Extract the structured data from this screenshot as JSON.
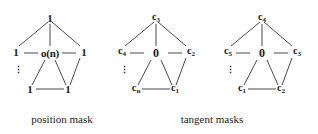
{
  "figure": {
    "type": "graph-diagram-set",
    "captions": [
      {
        "id": "position-mask",
        "text": "position mask"
      },
      {
        "id": "tangent-masks",
        "text": "tangent masks"
      }
    ],
    "stroke_color": "#1a1a1a",
    "background_color": "#ffffff"
  },
  "diagrams": [
    {
      "id": "position-mask",
      "center": {
        "label": "o(n)",
        "name": "center-node"
      },
      "nodes": [
        {
          "pos": "top",
          "label": "1"
        },
        {
          "pos": "left",
          "label": "1"
        },
        {
          "pos": "right",
          "label": "1"
        },
        {
          "pos": "bottom-left",
          "label": "1"
        },
        {
          "pos": "bottom-right",
          "label": "1"
        }
      ],
      "ellipsis": "⋮",
      "edges": [
        "top-left",
        "top-right",
        "top-center",
        "left-center",
        "right-center",
        "center-bottom-left",
        "center-bottom-right",
        "bottom-left-bottom-right",
        "right-bottom-right"
      ]
    },
    {
      "id": "tangent-mask-1",
      "center": {
        "label": "0",
        "name": "center-node"
      },
      "nodes": [
        {
          "pos": "top",
          "label": "c",
          "sub": "3"
        },
        {
          "pos": "left",
          "label": "c",
          "sub": "4"
        },
        {
          "pos": "right",
          "label": "c",
          "sub": "2"
        },
        {
          "pos": "bottom-left",
          "label": "c",
          "sub": "n"
        },
        {
          "pos": "bottom-right",
          "label": "c",
          "sub": "1"
        }
      ],
      "ellipsis": "⋮",
      "edges": [
        "top-left",
        "top-right",
        "top-center",
        "left-center",
        "right-center",
        "center-bottom-left",
        "center-bottom-right",
        "bottom-left-bottom-right",
        "right-bottom-right"
      ]
    },
    {
      "id": "tangent-mask-2",
      "center": {
        "label": "0",
        "name": "center-node"
      },
      "nodes": [
        {
          "pos": "top",
          "label": "c",
          "sub": "4"
        },
        {
          "pos": "left",
          "label": "c",
          "sub": "5"
        },
        {
          "pos": "right",
          "label": "c",
          "sub": "3"
        },
        {
          "pos": "bottom-left",
          "label": "c",
          "sub": "1"
        },
        {
          "pos": "bottom-right",
          "label": "c",
          "sub": "2"
        }
      ],
      "ellipsis": "⋮",
      "edges": [
        "top-left",
        "top-right",
        "top-center",
        "left-center",
        "right-center",
        "center-bottom-left",
        "center-bottom-right",
        "bottom-left-bottom-right",
        "right-bottom-right"
      ]
    }
  ]
}
